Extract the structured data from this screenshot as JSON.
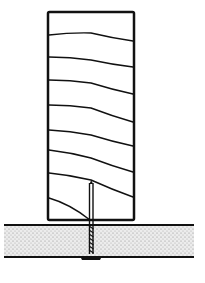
{
  "figure": {
    "colors": {
      "background": "#ffffff",
      "stroke": "#111111",
      "stipple": "#9a9a9a",
      "panel_fill": "#e4e4e4"
    },
    "stud": {
      "x": 48,
      "y": 12,
      "width": 86,
      "height": 208
    },
    "grain_lines": [
      {
        "y_left": 35,
        "y_mid": 33,
        "y_right": 41
      },
      {
        "y_left": 57,
        "y_mid": 60,
        "y_right": 67
      },
      {
        "y_left": 80,
        "y_mid": 83,
        "y_right": 94
      },
      {
        "y_left": 105,
        "y_mid": 108,
        "y_right": 122
      },
      {
        "y_left": 130,
        "y_mid": 135,
        "y_right": 146
      },
      {
        "y_left": 150,
        "y_mid": 158,
        "y_right": 172
      },
      {
        "y_left": 173,
        "y_mid": 180,
        "y_right": 197
      },
      {
        "y_left": 198,
        "y_mid": 208,
        "y_right": 220
      }
    ],
    "panel": {
      "x1": 4,
      "x2": 194,
      "y_top": 225,
      "y_bottom": 257
    },
    "screw": {
      "x": 91,
      "y_tip": 182,
      "y_head": 256,
      "head_width": 20
    }
  }
}
